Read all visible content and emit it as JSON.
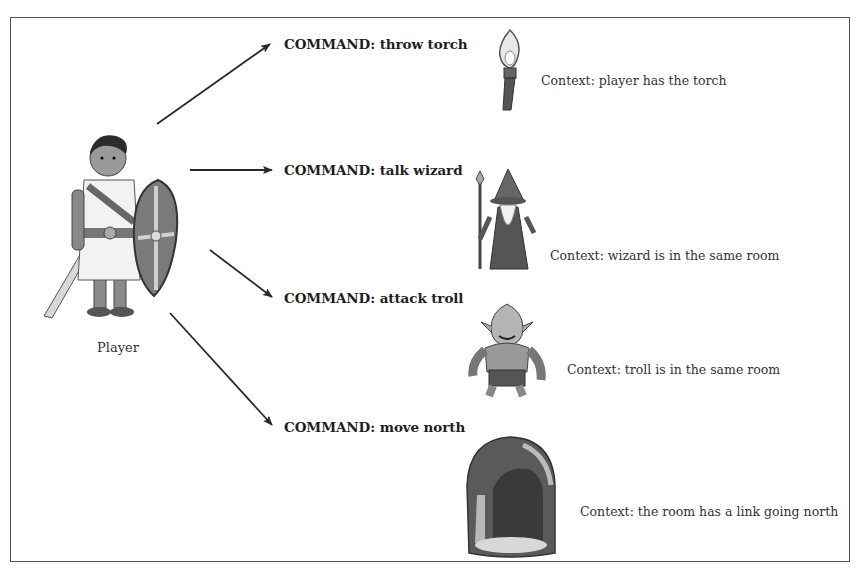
{
  "diagram": {
    "player": {
      "label": "Player",
      "icon": "player-warrior-icon"
    },
    "branches": [
      {
        "command": "COMMAND: throw torch",
        "context": "Context: player has the torch",
        "icon": "torch-icon"
      },
      {
        "command": "COMMAND: talk wizard",
        "context": "Context: wizard is in the same room",
        "icon": "wizard-icon"
      },
      {
        "command": "COMMAND: attack troll",
        "context": "Context: troll is in the same room",
        "icon": "troll-icon"
      },
      {
        "command": "COMMAND: move north",
        "context": "Context: the room has a link going north",
        "icon": "cave-icon"
      }
    ],
    "colors": {
      "frame": "#555555",
      "arrow": "#2a2a2a",
      "text": "#222222"
    }
  }
}
